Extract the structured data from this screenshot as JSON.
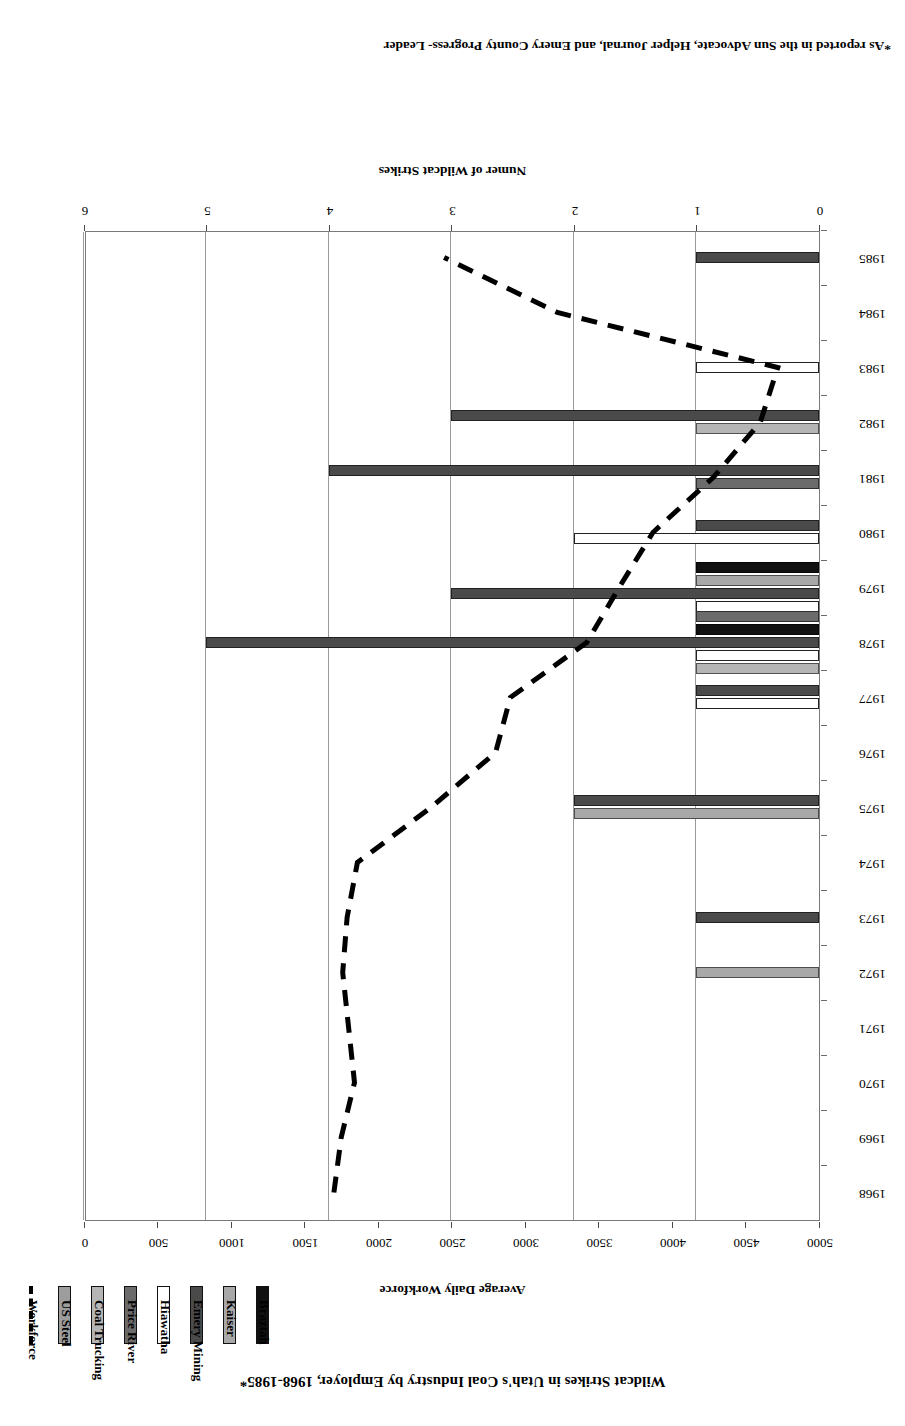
{
  "title": "Wildcat Strikes in Utah's Coal Industry by Employer, 1968-1985*",
  "footnote": "*As reported in the Sun Advocate, Helper Journal, and Emery County Progress- Leader",
  "legend": {
    "items": [
      {
        "label": "Braztah",
        "color": "#111111",
        "kind": "swatch"
      },
      {
        "label": "Kaiser",
        "color": "#a8a8a8",
        "kind": "swatch"
      },
      {
        "label": "Emery Mining",
        "color": "#4a4a4a",
        "kind": "swatch"
      },
      {
        "label": "Hiawatha",
        "color": "#ffffff",
        "kind": "swatch"
      },
      {
        "label": "Price River",
        "color": "#6b6b6b",
        "kind": "swatch"
      },
      {
        "label": "Coal Trucking",
        "color": "#b5b5b5",
        "kind": "swatch"
      },
      {
        "label": "US Steel",
        "color": "#9d9d9d",
        "kind": "swatch"
      },
      {
        "label": "Workforce",
        "color": "#000000",
        "kind": "line"
      }
    ]
  },
  "axes": {
    "strikes": {
      "title": "Numer of Wildcat Strikes",
      "ticks": [
        "0",
        "1",
        "2",
        "3",
        "4",
        "5",
        "6"
      ],
      "min": 0,
      "max": 6
    },
    "workforce": {
      "title": "Average Daily Workforce",
      "ticks": [
        "0",
        "500",
        "1000",
        "1500",
        "2000",
        "2500",
        "3000",
        "3500",
        "4000",
        "4500",
        "5000"
      ],
      "min": 0,
      "max": 5000
    },
    "years": [
      "1968",
      "1969",
      "1970",
      "1971",
      "1972",
      "1973",
      "1974",
      "1975",
      "1976",
      "1977",
      "1978",
      "1979",
      "1980",
      "1981",
      "1982",
      "1983",
      "1984",
      "1985"
    ]
  },
  "chart_data": {
    "type": "bar",
    "orientation": "horizontal-stacked-by-year",
    "title": "Wildcat Strikes in Utah's Coal Industry by Employer, 1968-1985*",
    "xlabel": "Numer of Wildcat Strikes",
    "ylabel": "Average Daily Workforce",
    "categories": [
      "1968",
      "1969",
      "1970",
      "1971",
      "1972",
      "1973",
      "1974",
      "1975",
      "1976",
      "1977",
      "1978",
      "1979",
      "1980",
      "1981",
      "1982",
      "1983",
      "1984",
      "1985"
    ],
    "xlim": [
      0,
      6
    ],
    "ylim": [
      0,
      5000
    ],
    "grid": "vertical",
    "legend_position": "top-right",
    "series": [
      {
        "name": "Braztah",
        "color": "#111111",
        "values": [
          0,
          0,
          0,
          0,
          0,
          0,
          0,
          0,
          0,
          1,
          1,
          1,
          0,
          0,
          0,
          0,
          0,
          0
        ]
      },
      {
        "name": "Kaiser",
        "color": "#a8a8a8",
        "values": [
          0,
          0,
          0,
          0,
          1,
          0,
          0,
          2,
          0,
          1,
          1,
          1,
          0,
          0,
          0,
          0,
          0,
          0
        ]
      },
      {
        "name": "Emery Mining",
        "color": "#4a4a4a",
        "values": [
          0,
          0,
          0,
          0,
          0,
          1,
          0,
          2,
          0,
          1,
          5,
          3,
          1,
          4,
          3,
          0,
          0,
          1
        ]
      },
      {
        "name": "Hiawatha",
        "color": "#ffffff",
        "values": [
          0,
          0,
          0,
          0,
          0,
          0,
          0,
          0,
          0,
          1,
          1,
          1,
          2,
          0,
          0,
          1,
          0,
          0
        ]
      },
      {
        "name": "Price River",
        "color": "#6b6b6b",
        "values": [
          0,
          0,
          0,
          0,
          0,
          0,
          0,
          0,
          0,
          0,
          1,
          0,
          0,
          1,
          0,
          0,
          0,
          0
        ]
      },
      {
        "name": "Coal Trucking",
        "color": "#b5b5b5",
        "values": [
          0,
          0,
          0,
          0,
          0,
          0,
          0,
          0,
          0,
          0,
          1,
          0,
          0,
          0,
          1,
          0,
          0,
          0
        ]
      },
      {
        "name": "US Steel",
        "color": "#9d9d9d",
        "values": [
          0,
          0,
          0,
          0,
          0,
          0,
          0,
          0,
          0,
          0,
          0,
          0,
          0,
          0,
          0,
          0,
          0,
          0
        ]
      }
    ],
    "line_series": {
      "name": "Workforce",
      "style": "dashed",
      "axis": "workforce",
      "values": [
        1700,
        1750,
        1840,
        1800,
        1760,
        1790,
        1860,
        2360,
        2800,
        2900,
        3420,
        3640,
        3870,
        4280,
        4600,
        4720,
        3220,
        2450
      ]
    },
    "bars": [
      {
        "year": "1985",
        "segments": [
          {
            "series": "Emery Mining",
            "color": "#4a4a4a",
            "start": 0,
            "length": 1
          }
        ]
      },
      {
        "year": "1984",
        "segments": []
      },
      {
        "year": "1983",
        "segments": [
          {
            "series": "Hiawatha",
            "color": "#ffffff",
            "start": 0,
            "length": 1
          }
        ]
      },
      {
        "year": "1982",
        "segments": [
          {
            "series": "Coal Trucking",
            "color": "#b5b5b5",
            "start": 0,
            "length": 1
          },
          {
            "series": "Emery Mining",
            "color": "#4a4a4a",
            "start": 0,
            "length": 3
          }
        ]
      },
      {
        "year": "1981",
        "segments": [
          {
            "series": "Price River",
            "color": "#6b6b6b",
            "start": 0,
            "length": 1
          },
          {
            "series": "Emery Mining",
            "color": "#4a4a4a",
            "start": 0,
            "length": 4
          }
        ]
      },
      {
        "year": "1980",
        "segments": [
          {
            "series": "Hiawatha",
            "color": "#ffffff",
            "start": 0,
            "length": 2
          },
          {
            "series": "Emery Mining",
            "color": "#4a4a4a",
            "start": 0,
            "length": 1
          }
        ]
      },
      {
        "year": "1979",
        "segments": [
          {
            "series": "Hiawatha",
            "color": "#ffffff",
            "start": 0,
            "length": 1
          },
          {
            "series": "Emery Mining",
            "color": "#4a4a4a",
            "start": 0,
            "length": 3
          },
          {
            "series": "Kaiser",
            "color": "#a8a8a8",
            "start": 0,
            "length": 1
          },
          {
            "series": "Braztah",
            "color": "#111111",
            "start": 0,
            "length": 1
          }
        ]
      },
      {
        "year": "1978",
        "segments": [
          {
            "series": "Coal Trucking",
            "color": "#b5b5b5",
            "start": 0,
            "length": 1
          },
          {
            "series": "Hiawatha",
            "color": "#ffffff",
            "start": 0,
            "length": 1
          },
          {
            "series": "Emery Mining",
            "color": "#4a4a4a",
            "start": 0,
            "length": 5
          },
          {
            "series": "Braztah",
            "color": "#111111",
            "start": 0,
            "length": 1
          },
          {
            "series": "Price River",
            "color": "#6b6b6b",
            "start": 0,
            "length": 1
          }
        ]
      },
      {
        "year": "1977",
        "segments": [
          {
            "series": "Hiawatha",
            "color": "#ffffff",
            "start": 0,
            "length": 1
          },
          {
            "series": "Emery Mining",
            "color": "#4a4a4a",
            "start": 0,
            "length": 1
          }
        ]
      },
      {
        "year": "1976",
        "segments": []
      },
      {
        "year": "1975",
        "segments": [
          {
            "series": "Kaiser",
            "color": "#a8a8a8",
            "start": 0,
            "length": 2
          },
          {
            "series": "Emery Mining",
            "color": "#4a4a4a",
            "start": 0,
            "length": 2
          }
        ]
      },
      {
        "year": "1974",
        "segments": []
      },
      {
        "year": "1973",
        "segments": [
          {
            "series": "Emery Mining",
            "color": "#4a4a4a",
            "start": 0,
            "length": 1
          }
        ]
      },
      {
        "year": "1972",
        "segments": [
          {
            "series": "Kaiser",
            "color": "#a8a8a8",
            "start": 0,
            "length": 1
          }
        ]
      },
      {
        "year": "1971",
        "segments": []
      },
      {
        "year": "1970",
        "segments": []
      },
      {
        "year": "1969",
        "segments": []
      },
      {
        "year": "1968",
        "segments": []
      }
    ]
  }
}
